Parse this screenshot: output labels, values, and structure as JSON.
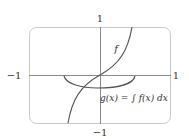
{
  "diagram": {
    "axis_labels": {
      "top": "1",
      "bottom": "−1",
      "left": "−1",
      "right": "1"
    },
    "curves": [
      {
        "name": "f",
        "label": "f"
      },
      {
        "name": "g",
        "label": "g(x) = ∫ f(x) dx"
      }
    ],
    "colors": {
      "frame": "#c8c8c8",
      "axes": "#8a8a8a",
      "curve": "#555555",
      "text": "#333333"
    }
  }
}
